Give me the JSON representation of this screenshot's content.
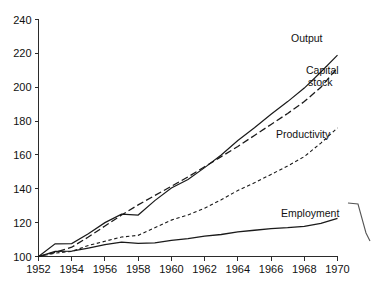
{
  "chart_data": {
    "type": "line",
    "title": "",
    "subtitle": "",
    "xlabel": "",
    "ylabel": "",
    "index_base": "1952 = 100",
    "xlim": [
      1952,
      1970
    ],
    "ylim": [
      100,
      240
    ],
    "xticks": [
      1952,
      1954,
      1956,
      1958,
      1960,
      1962,
      1964,
      1966,
      1968,
      1970
    ],
    "xtick_labels": [
      "1952",
      "1954",
      "1956",
      "1958",
      "1960",
      "1962",
      "1964",
      "1966",
      "1968",
      "1970"
    ],
    "yticks": [
      100,
      120,
      140,
      160,
      180,
      200,
      220,
      240
    ],
    "ytick_labels": [
      "100",
      "120",
      "140",
      "160",
      "180",
      "200",
      "220",
      "240"
    ],
    "grid": false,
    "legend_position": "inline-right-of-lines",
    "x": [
      1952,
      1953,
      1954,
      1955,
      1956,
      1957,
      1958,
      1959,
      1960,
      1961,
      1962,
      1963,
      1964,
      1965,
      1966,
      1967,
      1968,
      1969,
      1970
    ],
    "series": [
      {
        "name": "Output",
        "style": "solid",
        "label": "Output",
        "values": [
          100.0,
          107.5,
          107.6,
          113.5,
          120.0,
          125.0,
          124.5,
          133.0,
          140.5,
          145.5,
          152.5,
          160.0,
          168.5,
          176.0,
          184.0,
          191.5,
          199.5,
          209.0,
          219.0
        ]
      },
      {
        "name": "Capital stock",
        "style": "long-dash",
        "label": "Capital stock",
        "values": [
          100.0,
          102.5,
          105.5,
          111.5,
          118.0,
          124.5,
          130.5,
          136.0,
          141.5,
          147.0,
          153.0,
          159.0,
          165.0,
          171.5,
          178.0,
          184.5,
          191.5,
          200.0,
          211.5
        ]
      },
      {
        "name": "Productivity",
        "style": "short-dash",
        "label": "Productivity",
        "values": [
          100.0,
          102.0,
          103.0,
          106.5,
          109.0,
          111.5,
          112.5,
          117.0,
          121.5,
          124.5,
          128.5,
          133.5,
          139.0,
          143.5,
          148.5,
          153.5,
          159.0,
          167.0,
          176.0
        ]
      },
      {
        "name": "Employment",
        "style": "solid",
        "label": "Employment",
        "values": [
          100.0,
          103.0,
          103.2,
          105.0,
          107.0,
          108.5,
          107.8,
          108.0,
          109.5,
          110.5,
          112.0,
          113.0,
          114.5,
          115.5,
          116.5,
          117.0,
          117.8,
          119.5,
          122.5
        ]
      }
    ],
    "series_label_positions": [
      {
        "name": "Output",
        "x_px": 291,
        "y_px": 42
      },
      {
        "name": "Capital stock",
        "x_px": 306,
        "y_px": 74
      },
      {
        "name": "Capital stock line 2",
        "x_px": 308,
        "y_px": 86
      },
      {
        "name": "Productivity",
        "x_px": 276,
        "y_px": 138
      },
      {
        "name": "Employment",
        "x_px": 281,
        "y_px": 217
      }
    ],
    "colors": {
      "background": "#ffffff",
      "axis": "#2b2b2b",
      "line": "#1a1a1a",
      "text": "#111111"
    },
    "annotations": [
      {
        "name": "scan-artifact-bracket",
        "description": "curved scanning artifact at right edge"
      }
    ]
  },
  "labels": {
    "output": "Output",
    "capital_stock_line1": "Capital",
    "capital_stock_line2": "stock",
    "productivity": "Productivity",
    "employment": "Employment"
  }
}
